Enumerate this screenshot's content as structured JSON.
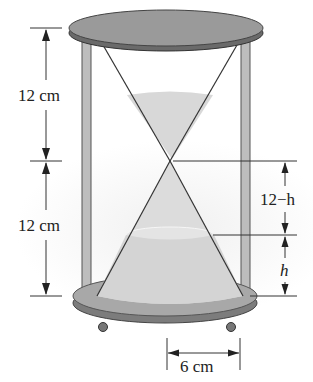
{
  "diagram": {
    "labels": {
      "top_height": "12 cm",
      "bottom_height": "12 cm",
      "upper_gap": "12−h",
      "sand_height": "h",
      "radius": "6 cm"
    },
    "colors": {
      "cap_fill": "#8f8f8f",
      "cap_edge": "#5a5a5a",
      "post_fill": "#bdbdbd",
      "sand_fill": "#d6d6d6",
      "line": "#333333",
      "background_glow": "#f2f2f2"
    }
  }
}
